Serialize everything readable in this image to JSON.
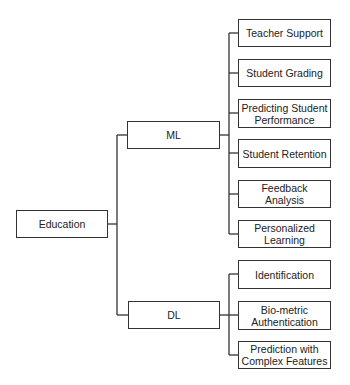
{
  "diagram": {
    "type": "tree",
    "root": {
      "id": "education",
      "label": "Education"
    },
    "branches": [
      {
        "id": "ml",
        "label": "ML",
        "children": [
          {
            "id": "teacher-support",
            "label": "Teacher Support"
          },
          {
            "id": "student-grading",
            "label": "Student Grading"
          },
          {
            "id": "predicting-student-performance",
            "label": "Predicting Student\nPerformance"
          },
          {
            "id": "student-retention",
            "label": "Student Retention"
          },
          {
            "id": "feedback-analysis",
            "label": "Feedback\nAnalysis"
          },
          {
            "id": "personalized-learning",
            "label": "Personalized\nLearning"
          }
        ]
      },
      {
        "id": "dl",
        "label": "DL",
        "children": [
          {
            "id": "identification",
            "label": "Identification"
          },
          {
            "id": "bio-metric-authentication",
            "label": "Bio-metric\nAuthentication"
          },
          {
            "id": "prediction-with-complex-features",
            "label": "Prediction with\nComplex Features"
          }
        ]
      }
    ],
    "colors": {
      "line": "#333333",
      "text": "#222222",
      "background": "#ffffff"
    }
  }
}
